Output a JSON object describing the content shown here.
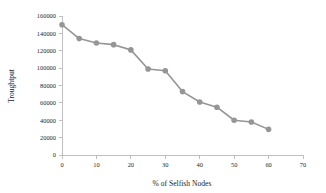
{
  "figure": {
    "background_color": "#ffffff",
    "text_color": "#231f20"
  },
  "chart_data": {
    "type": "line",
    "title": "",
    "xlabel": "% of Selfish Nodes",
    "ylabel": "Troughtput",
    "x": [
      0,
      5,
      10,
      15,
      20,
      25,
      30,
      35,
      40,
      45,
      50,
      55,
      60
    ],
    "values": [
      150000,
      134000,
      129000,
      127000,
      121000,
      99000,
      97000,
      73000,
      61000,
      55000,
      40000,
      38000,
      29500
    ],
    "series": [
      {
        "name": "Troughtput",
        "x": [
          0,
          5,
          10,
          15,
          20,
          25,
          30,
          35,
          40,
          45,
          50,
          55,
          60
        ],
        "values": [
          150000,
          134000,
          129000,
          127000,
          121000,
          99000,
          97000,
          73000,
          61000,
          55000,
          40000,
          38000,
          29500
        ]
      }
    ],
    "xlim": [
      0,
      70
    ],
    "ylim": [
      0,
      160000
    ],
    "xticks": [
      0,
      10,
      20,
      30,
      40,
      50,
      60,
      70
    ],
    "yticks": [
      0,
      20000,
      40000,
      60000,
      80000,
      100000,
      120000,
      140000,
      160000
    ],
    "xtick_labels": [
      "0",
      "10",
      "20",
      "30",
      "40",
      "50",
      "60",
      "70"
    ],
    "ytick_labels": [
      "0",
      "20000",
      "40000",
      "60000",
      "80000",
      "100000",
      "120000",
      "140000",
      "160000"
    ],
    "grid": false,
    "legend": false,
    "legend_position": "none",
    "line_color": "#969696",
    "marker_color": "#969696",
    "marker": "circle",
    "axis_color": "#b0b0b0"
  }
}
